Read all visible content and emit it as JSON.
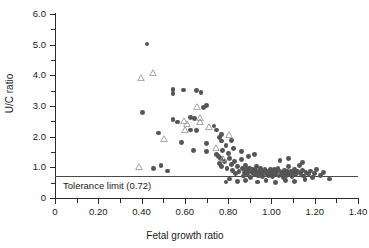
{
  "chart_data": {
    "type": "scatter",
    "title": "",
    "xlabel": "Fetal growth ratio",
    "ylabel": "U/C ratio",
    "xlim": [
      0,
      1.4
    ],
    "ylim": [
      0,
      6.0
    ],
    "x_ticks": [
      "0",
      "0.20",
      "0.40",
      "0.60",
      "0.80",
      "1.00",
      "1.20",
      "1.40"
    ],
    "x_tick_values": [
      0,
      0.2,
      0.4,
      0.6,
      0.8,
      1.0,
      1.2,
      1.4
    ],
    "x_minor_step": 0.1,
    "y_ticks": [
      "0",
      "1.0",
      "2.0",
      "3.0",
      "4.0",
      "5.0",
      "6.0"
    ],
    "y_tick_values": [
      0,
      1.0,
      2.0,
      3.0,
      4.0,
      5.0,
      6.0
    ],
    "y_minor_step": 0.5,
    "grid": false,
    "legend": "none",
    "annotations": [
      {
        "name": "tolerance-limit",
        "label": "Tolerance limit (0.72)",
        "y": 0.72,
        "type": "hline"
      }
    ],
    "series": [
      {
        "name": "circles",
        "marker": "filled-circle",
        "color": "#555555",
        "points": [
          [
            0.425,
            5.02
          ],
          [
            0.405,
            2.8
          ],
          [
            0.545,
            3.55
          ],
          [
            0.545,
            3.42
          ],
          [
            0.595,
            3.52
          ],
          [
            0.655,
            3.5
          ],
          [
            0.675,
            3.45
          ],
          [
            0.545,
            2.55
          ],
          [
            0.565,
            2.48
          ],
          [
            0.625,
            2.62
          ],
          [
            0.645,
            2.6
          ],
          [
            0.685,
            2.95
          ],
          [
            0.7,
            3.02
          ],
          [
            0.655,
            2.2
          ],
          [
            0.625,
            2.22
          ],
          [
            0.48,
            2.12
          ],
          [
            0.585,
            1.82
          ],
          [
            0.7,
            1.78
          ],
          [
            0.735,
            2.35
          ],
          [
            0.745,
            2.22
          ],
          [
            0.76,
            1.98
          ],
          [
            0.77,
            1.86
          ],
          [
            0.64,
            1.55
          ],
          [
            0.7,
            1.52
          ],
          [
            0.745,
            1.42
          ],
          [
            0.755,
            1.35
          ],
          [
            0.765,
            1.28
          ],
          [
            0.775,
            1.55
          ],
          [
            0.455,
            0.95
          ],
          [
            0.49,
            1.05
          ],
          [
            0.52,
            0.88
          ],
          [
            0.76,
            1.12
          ],
          [
            0.77,
            1.02
          ],
          [
            0.785,
            1.2
          ],
          [
            0.795,
            0.95
          ],
          [
            0.8,
            1.45
          ],
          [
            0.805,
            1.3
          ],
          [
            0.815,
            1.08
          ],
          [
            0.82,
            0.9
          ],
          [
            0.83,
            1.18
          ],
          [
            0.835,
            0.8
          ],
          [
            0.845,
            1.02
          ],
          [
            0.85,
            0.86
          ],
          [
            0.86,
            1.25
          ],
          [
            0.865,
            0.95
          ],
          [
            0.87,
            0.72
          ],
          [
            0.875,
            0.84
          ],
          [
            0.88,
            1.05
          ],
          [
            0.885,
            0.92
          ],
          [
            0.89,
            0.78
          ],
          [
            0.895,
            0.88
          ],
          [
            0.9,
            0.98
          ],
          [
            0.905,
            0.68
          ],
          [
            0.91,
            0.82
          ],
          [
            0.915,
            0.94
          ],
          [
            0.92,
            0.76
          ],
          [
            0.925,
            0.9
          ],
          [
            0.93,
            1.02
          ],
          [
            0.935,
            0.84
          ],
          [
            0.94,
            0.72
          ],
          [
            0.945,
            0.88
          ],
          [
            0.95,
            0.96
          ],
          [
            0.955,
            0.8
          ],
          [
            0.96,
            0.7
          ],
          [
            0.965,
            0.86
          ],
          [
            0.97,
            0.92
          ],
          [
            0.975,
            0.78
          ],
          [
            0.98,
            0.88
          ],
          [
            0.985,
            0.74
          ],
          [
            0.99,
            0.84
          ],
          [
            0.995,
            0.94
          ],
          [
            1.0,
            0.8
          ],
          [
            1.005,
            0.7
          ],
          [
            1.01,
            0.86
          ],
          [
            1.015,
            0.92
          ],
          [
            1.02,
            0.76
          ],
          [
            1.025,
            0.82
          ],
          [
            1.03,
            0.96
          ],
          [
            1.035,
            0.72
          ],
          [
            1.04,
            0.88
          ],
          [
            1.045,
            0.78
          ],
          [
            1.05,
            0.84
          ],
          [
            1.055,
            0.68
          ],
          [
            1.06,
            0.9
          ],
          [
            1.065,
            0.8
          ],
          [
            1.07,
            0.74
          ],
          [
            1.075,
            0.86
          ],
          [
            1.08,
            1.02
          ],
          [
            1.085,
            0.78
          ],
          [
            1.09,
            0.88
          ],
          [
            1.095,
            0.7
          ],
          [
            1.1,
            0.82
          ],
          [
            1.105,
            0.94
          ],
          [
            1.11,
            0.76
          ],
          [
            1.12,
            0.86
          ],
          [
            1.13,
            1.05
          ],
          [
            1.135,
            0.8
          ],
          [
            1.145,
            0.9
          ],
          [
            1.15,
            0.72
          ],
          [
            1.16,
            0.84
          ],
          [
            1.17,
            0.78
          ],
          [
            1.18,
            0.88
          ],
          [
            1.19,
            0.68
          ],
          [
            1.2,
            0.8
          ],
          [
            1.21,
            0.92
          ],
          [
            1.225,
            0.74
          ],
          [
            1.24,
            0.82
          ],
          [
            1.27,
            0.62
          ],
          [
            0.845,
            0.55
          ],
          [
            0.88,
            0.58
          ],
          [
            0.935,
            0.52
          ],
          [
            0.975,
            0.56
          ],
          [
            1.02,
            0.5
          ],
          [
            1.065,
            0.58
          ],
          [
            1.105,
            0.54
          ],
          [
            1.155,
            0.6
          ],
          [
            0.805,
            0.62
          ],
          [
            0.79,
            0.52
          ],
          [
            0.895,
            1.35
          ],
          [
            0.92,
            1.42
          ],
          [
            0.86,
            1.52
          ],
          [
            0.825,
            1.62
          ],
          [
            1.04,
            1.22
          ],
          [
            1.08,
            1.28
          ],
          [
            1.145,
            1.15
          ],
          [
            0.79,
            1.72
          ],
          [
            0.815,
            1.88
          ],
          [
            0.77,
            2.08
          ]
        ]
      },
      {
        "name": "triangles",
        "marker": "open-triangle",
        "color": "#9a9a9a",
        "points": [
          [
            0.398,
            3.92
          ],
          [
            0.452,
            4.08
          ],
          [
            0.655,
            2.98
          ],
          [
            0.598,
            2.52
          ],
          [
            0.612,
            2.4
          ],
          [
            0.672,
            2.62
          ],
          [
            0.668,
            2.48
          ],
          [
            0.6,
            2.22
          ],
          [
            0.505,
            1.92
          ],
          [
            0.712,
            2.3
          ],
          [
            0.742,
            1.62
          ],
          [
            0.388,
            1.0
          ],
          [
            0.775,
            1.28
          ],
          [
            0.805,
            2.05
          ]
        ]
      }
    ]
  }
}
